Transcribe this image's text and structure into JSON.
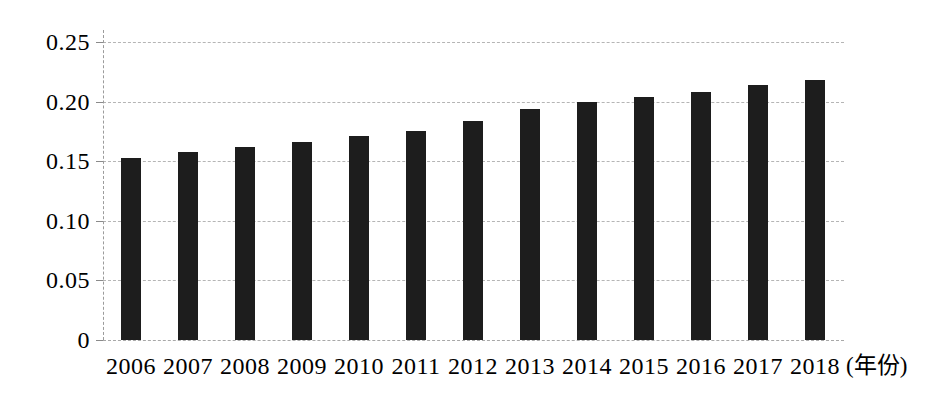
{
  "chart_data": {
    "type": "bar",
    "title": "",
    "categories": [
      "2006",
      "2007",
      "2008",
      "2009",
      "2010",
      "2011",
      "2012",
      "2013",
      "2014",
      "2015",
      "2016",
      "2017",
      "2018"
    ],
    "values": [
      0.153,
      0.158,
      0.162,
      0.166,
      0.171,
      0.175,
      0.184,
      0.194,
      0.2,
      0.204,
      0.208,
      0.214,
      0.218
    ],
    "xlabel": "(年份)",
    "ylabel": "",
    "ylim": [
      0,
      0.26
    ],
    "ytick_values": [
      0,
      0.05,
      0.1,
      0.15,
      0.2,
      0.25
    ],
    "ytick_labels": [
      "0",
      "0.05",
      "0.10",
      "0.15",
      "0.20",
      "0.25"
    ],
    "grid": true,
    "gridline_style": "dashed",
    "legend_position": "none"
  },
  "colors": {
    "background": "#ffffff",
    "bar": "#1d1d1d",
    "gridline": "#b5b5b5",
    "axis": "#9b9b9b",
    "tick": "#8a8a8a",
    "text": "#000000"
  }
}
